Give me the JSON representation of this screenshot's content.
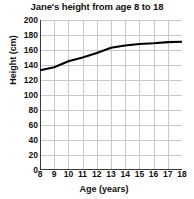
{
  "chart_data": {
    "type": "line",
    "title": "Jane's height from age 8 to 18",
    "xlabel": "Age (years)",
    "ylabel": "Height (cm)",
    "x": [
      8,
      9,
      10,
      11,
      12,
      13,
      14,
      15,
      16,
      17,
      18
    ],
    "values": [
      133,
      137,
      145,
      150,
      156,
      163,
      166,
      168,
      169,
      170.5,
      171
    ],
    "series": [
      {
        "name": "Jane's height",
        "values": [
          133,
          137,
          145,
          150,
          156,
          163,
          166,
          168,
          169,
          170.5,
          171
        ]
      }
    ],
    "xlim": [
      8,
      18
    ],
    "ylim": [
      0,
      200
    ],
    "xticks": [
      "8",
      "9",
      "10",
      "11",
      "12",
      "13",
      "14",
      "15",
      "16",
      "17",
      "18"
    ],
    "yticks": [
      "0",
      "20",
      "40",
      "60",
      "80",
      "100",
      "120",
      "140",
      "160",
      "180",
      "200"
    ],
    "grid": true,
    "legend": "none",
    "line_color": "#000000",
    "grid_color": "#c8c8c8",
    "axis_color": "#3a3a3a",
    "background_color": "#ffffff"
  }
}
